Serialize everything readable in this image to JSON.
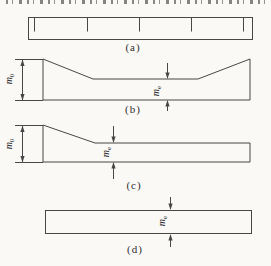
{
  "figure": {
    "colors": {
      "line": "#474747",
      "paper": "#faf9f6",
      "text": "#2e2e2e"
    },
    "panels": [
      {
        "key": "a",
        "caption": "(a)"
      },
      {
        "key": "b",
        "caption": "(b)",
        "outer_dim": {
          "base": "m",
          "sub": "0"
        },
        "inner_dim": {
          "base": "m",
          "sub": "e"
        }
      },
      {
        "key": "c",
        "caption": "(c)",
        "outer_dim": {
          "base": "m",
          "sub": "0"
        },
        "inner_dim": {
          "base": "m",
          "sub": "e"
        }
      },
      {
        "key": "d",
        "caption": "(d)",
        "inner_dim": {
          "base": "m",
          "sub": "e"
        }
      }
    ]
  }
}
